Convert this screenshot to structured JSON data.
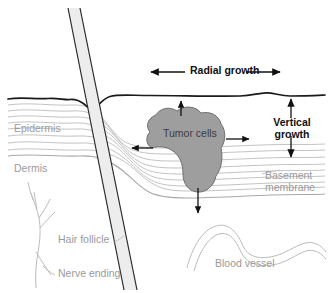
{
  "figure": {
    "background_color": "#ffffff",
    "width": 331,
    "height": 293
  },
  "labels": {
    "radial_growth": "Radial growth",
    "vertical_growth_line1": "Vertical",
    "vertical_growth_line2": "growth",
    "epidermis": "Epidermis",
    "dermis": "Dermis",
    "tumor_cells": "Tumor cells",
    "basement_membrane_line1": "Basement",
    "basement_membrane_line2": "membrane",
    "hair_follicle": "Hair follicle",
    "nerve_ending": "Nerve ending",
    "blood_vessel": "Blood vessel"
  },
  "colors": {
    "skin_surface_line": "#1a1a1a",
    "epidermis_layer_line": "#b8b8b8",
    "basement_membrane_line": "#a8a8a8",
    "tumor_fill": "#9e9e9e",
    "tumor_stroke": "#6e6e6e",
    "hair_shaft_fill": "#ededed",
    "hair_shaft_stroke": "#2b2b2b",
    "nerve_line": "#bdbdbd",
    "blood_vessel_line": "#bcbcbc",
    "arrow_dark": "#111111",
    "label_grey": "#9a9a9a",
    "label_dark": "#3a3a3a",
    "background": "#ffffff"
  },
  "annotations": {
    "arrows": [
      {
        "name": "radial-growth-left-arrow",
        "direction": "left"
      },
      {
        "name": "radial-growth-right-arrow",
        "direction": "right"
      },
      {
        "name": "vertical-growth-up-arrow",
        "direction": "up"
      },
      {
        "name": "vertical-growth-down-arrow",
        "direction": "down"
      },
      {
        "name": "tumor-up-arrow",
        "direction": "up"
      },
      {
        "name": "tumor-down-arrow",
        "direction": "down"
      },
      {
        "name": "tumor-left-arrow",
        "direction": "left"
      },
      {
        "name": "tumor-right-arrow",
        "direction": "right"
      }
    ],
    "leader_lines": [
      {
        "name": "hair-follicle-leader"
      },
      {
        "name": "nerve-ending-leader"
      },
      {
        "name": "basement-membrane-leader"
      }
    ]
  }
}
